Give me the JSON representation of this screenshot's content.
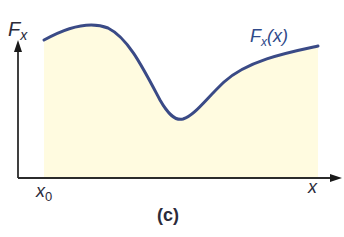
{
  "figure": {
    "caption": "(c)",
    "y_axis_label": "F",
    "y_axis_label_sub": "x",
    "x_axis_label": "x",
    "x_origin_label": "x",
    "x_origin_label_sub": "0",
    "curve_label": "F",
    "curve_label_sub": "x",
    "curve_label_arg": "(x)"
  },
  "colors": {
    "curve": "#3a4a86",
    "fill": "#fffbe0",
    "axis": "#2b2b2b",
    "label": "#2f4a8a"
  }
}
